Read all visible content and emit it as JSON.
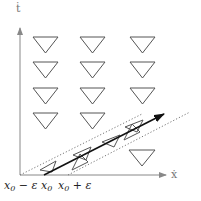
{
  "diagram": {
    "axes": {
      "x_label": "ẋ",
      "y_label": "ṫ"
    },
    "tick_labels": {
      "left": {
        "base": "x",
        "sub": "0",
        "suffix": " − ε"
      },
      "center": {
        "base": "x",
        "sub": "0",
        "suffix": ""
      },
      "right": {
        "base": "x",
        "sub": "0",
        "suffix": " + ε"
      }
    },
    "grid_triangles": {
      "columns": 3,
      "rows": 4,
      "extra": "one triangle at bottom-right column, row 5"
    },
    "arrow": "solid arrow from x0 diagonally up-right",
    "bounds": "dotted lines from x0 − ε and x0 + ε parallel to arrow",
    "colors": {
      "triangle_stroke": "#555555",
      "axis": "#888888",
      "arrow": "#111111",
      "dotted": "#777777"
    }
  }
}
